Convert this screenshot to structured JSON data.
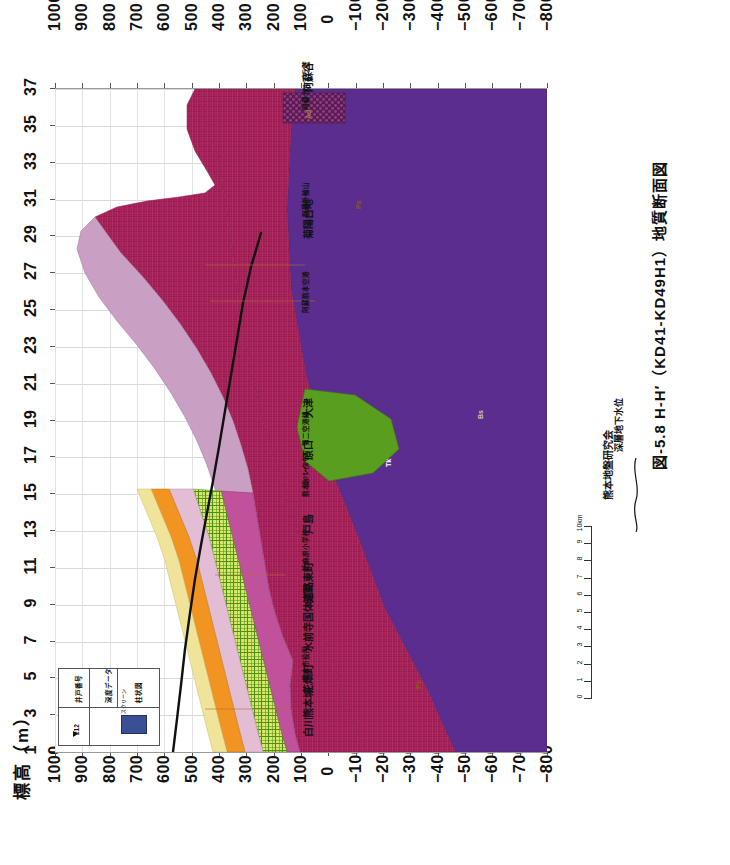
{
  "figure": {
    "caption": "図-5.8  H-H′（KD41-KD49H1）地質断面図",
    "credit": "熊本地盤研究会"
  },
  "axes": {
    "elevation_title": "標高（m）",
    "elevation_unit": "m",
    "elevation_ticks": [
      "1000",
      "900",
      "800",
      "700",
      "600",
      "500",
      "400",
      "300",
      "200",
      "100",
      "0",
      "-100",
      "-200",
      "-300",
      "-400",
      "-500",
      "-600",
      "-700",
      "-800"
    ],
    "elevation_ticks_bottom": [
      "1000",
      "900",
      "800",
      "700",
      "600",
      "500",
      "400",
      "300",
      "200",
      "100",
      "0",
      "-100",
      "-200",
      "-300",
      "-400",
      "-500",
      "-600",
      "-700",
      "-800"
    ],
    "distance_ticks": [
      "1",
      "3",
      "5",
      "7",
      "9",
      "11",
      "13",
      "15",
      "17",
      "19",
      "21",
      "23",
      "25",
      "27",
      "29",
      "31",
      "33",
      "35",
      "37"
    ],
    "elev_max": 1000,
    "elev_min": -800,
    "dist_min": 1,
    "dist_max": 37
  },
  "scalebar": {
    "ticks": [
      "0",
      "1",
      "2",
      "3",
      "4",
      "5",
      "6",
      "7",
      "8",
      "9",
      "10km"
    ],
    "unit": "km"
  },
  "groundwater_legend": {
    "label": "深層地下水位",
    "symbol": "wavy-line"
  },
  "well_legend": {
    "col_well_no": "井戸番号",
    "col_depth_data": "深度データ",
    "col_log": "柱状図",
    "sample_id": "212",
    "swatch_label": "スクリーン",
    "swatch_color": "#3b4f94"
  },
  "places": [
    {
      "name": "白川",
      "dist": 2.0
    },
    {
      "name": "熊本城",
      "dist": 3.0
    },
    {
      "name": "花畑町",
      "dist": 4.3
    },
    {
      "name": "熊本市役所",
      "dist": 5.0
    },
    {
      "name": "水前寺",
      "dist": 6.6
    },
    {
      "name": "国体道路",
      "dist": 8.2
    },
    {
      "name": "健軍",
      "dist": 9.2
    },
    {
      "name": "東町",
      "dist": 10.4
    },
    {
      "name": "託麻原小学校",
      "dist": 11.0
    },
    {
      "name": "戸島",
      "dist": 13.0
    },
    {
      "name": "熊本インター",
      "dist": 15.0
    },
    {
      "name": "東バイパス",
      "dist": 15.6
    },
    {
      "name": "原口",
      "dist": 17.0
    },
    {
      "name": "第二空港線",
      "dist": 17.8
    },
    {
      "name": "大津",
      "dist": 19.3
    },
    {
      "name": "阿蘇熊本空港",
      "dist": 25.0
    },
    {
      "name": "菊陽台地",
      "dist": 29.0
    },
    {
      "name": "阿蘇外輪山",
      "dist": 30.2
    },
    {
      "name": "阿蘇カルデラ壁",
      "dist": 36.0
    },
    {
      "name": "阿蘇谷",
      "dist": 37.0
    }
  ],
  "geology_units": [
    {
      "code": "Ag",
      "name": "沖積層",
      "color": "#efe49a",
      "pattern": "solid"
    },
    {
      "code": "Aso-4",
      "name": "阿蘇4火砕流堆積物",
      "color": "#f29421",
      "pattern": "solid"
    },
    {
      "code": "Aso-3",
      "name": "阿蘇3火砕流堆積物",
      "color": "#e3bdd4",
      "pattern": "solid"
    },
    {
      "code": "Aso-2",
      "name": "阿蘇2火砕流堆積物",
      "color": "#c0519b",
      "pattern": "solid"
    },
    {
      "code": "Aso-1",
      "name": "阿蘇1火砕流堆積物",
      "color": "#b5cf3d",
      "pattern": "checker"
    },
    {
      "code": "Tk",
      "name": "託麻層群",
      "color": "#5a9e1f",
      "pattern": "solid"
    },
    {
      "code": "Ps",
      "name": "先阿蘇火山岩類",
      "color": "#a6215a",
      "pattern": "hatch"
    },
    {
      "code": "Bs",
      "name": "基盤岩類",
      "color": "#5b2d8e",
      "pattern": "solid"
    },
    {
      "code": "Ad",
      "name": "安山岩",
      "color": "#6b2060",
      "pattern": "dots"
    },
    {
      "code": "Ms",
      "name": "三郎層",
      "color": "#c9a0c4",
      "pattern": "solid"
    }
  ],
  "chart_data": {
    "type": "area",
    "title": "図-5.8  H-H′（KD41-KD49H1）地質断面図",
    "xlabel": "測点番号",
    "ylabel": "標高（m）",
    "xlim": [
      1,
      37
    ],
    "ylim": [
      -800,
      1000
    ],
    "grid": true,
    "x": [
      1,
      3,
      5,
      7,
      9,
      11,
      13,
      15,
      17,
      19,
      21,
      23,
      25,
      27,
      29,
      31,
      33,
      35,
      37
    ],
    "series": [
      {
        "name": "地表面（標高）",
        "unit": "m",
        "values": [
          40,
          30,
          25,
          20,
          25,
          10,
          35,
          45,
          60,
          70,
          80,
          95,
          110,
          140,
          180,
          230,
          330,
          520,
          300
        ]
      },
      {
        "name": "阿蘇4火砕流堆積物下面",
        "unit": "m",
        "values": [
          -20,
          -25,
          -30,
          -35,
          -35,
          -40,
          -20,
          -10,
          5,
          20,
          35,
          50,
          70,
          95,
          130,
          175,
          260,
          430,
          230
        ]
      },
      {
        "name": "阿蘇1火砕流堆積物下面",
        "unit": "m",
        "values": [
          -70,
          -80,
          -85,
          -95,
          -100,
          -110,
          -95,
          -85,
          -70,
          -55,
          -35,
          -15,
          15,
          55,
          95,
          145,
          225,
          390,
          190
        ]
      },
      {
        "name": "先阿蘇火山岩類上面",
        "unit": "m",
        "values": [
          -90,
          -100,
          -110,
          -120,
          -125,
          -135,
          -125,
          -115,
          -100,
          -85,
          -60,
          -40,
          -5,
          40,
          85,
          135,
          215,
          380,
          180
        ]
      },
      {
        "name": "基盤岩類上面",
        "unit": "m",
        "values": [
          -420,
          -440,
          -470,
          -500,
          -530,
          -560,
          -600,
          -640,
          -660,
          -680,
          -700,
          -700,
          -700,
          -700,
          -700,
          -700,
          -700,
          -700,
          -700
        ]
      },
      {
        "name": "深層地下水位",
        "unit": "m",
        "values": [
          10,
          5,
          0,
          -5,
          -5,
          -8,
          5,
          15,
          25,
          40,
          55,
          70,
          90,
          120,
          160,
          210,
          null,
          null,
          null
        ]
      }
    ]
  }
}
